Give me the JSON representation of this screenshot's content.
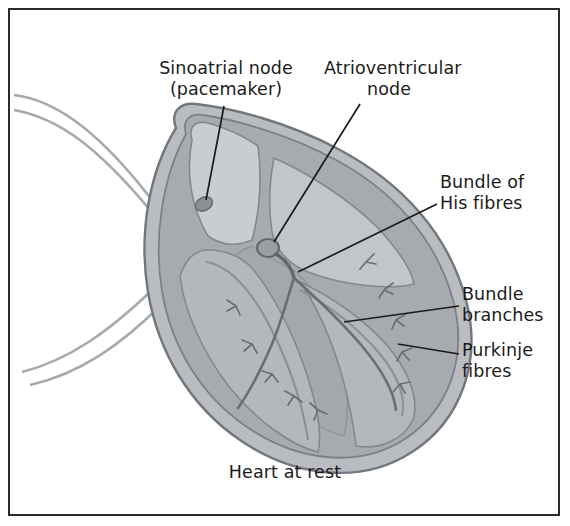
{
  "figure": {
    "caption": "Heart at rest",
    "border_color": "#2b2b2b",
    "background": "#ffffff"
  },
  "labels": {
    "sinoatrial_node": "Sinoatrial node\n(pacemaker)",
    "atrioventricular_node": "Atrioventricular\nnode",
    "bundle_of_his": "Bundle of\nHis fibres",
    "bundle_branches": "Bundle\nbranches",
    "purkinje_fibres": "Purkinje\nfibres"
  },
  "diagram": {
    "colors": {
      "outer_wall": "#b9bcc0",
      "outer_wall_edge": "#6f7378",
      "myocardium": "#9b9fa5",
      "chamber_light": "#cdd0d4",
      "chamber_mid": "#b3b7bc",
      "vessel_line": "#8f9398",
      "conduction_line": "#6a6e73",
      "leader_line": "#1b1b1b"
    },
    "parts": [
      "superior vena cava",
      "pulmonary vessels",
      "right atrium",
      "left atrium",
      "right ventricle",
      "left ventricle",
      "interventricular septum",
      "sinoatrial node",
      "atrioventricular node",
      "bundle of His",
      "left bundle branch",
      "right bundle branch",
      "purkinje fibres"
    ]
  }
}
